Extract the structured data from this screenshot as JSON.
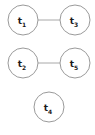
{
  "diagram": {
    "background_color": "#ffffff",
    "width": 95,
    "height": 135,
    "node_style": {
      "fill": "#ffffff",
      "stroke": "#9a9a9a",
      "radius": 15
    },
    "edge_style": {
      "stroke": "#a8a8a8"
    },
    "label_color": "#1a1a1a",
    "nodes": [
      {
        "id": "t1",
        "base": "t",
        "subscript": "1",
        "label": "t1",
        "cx": 23,
        "cy": 20
      },
      {
        "id": "t3",
        "base": "t",
        "subscript": "3",
        "label": "t3",
        "cx": 75,
        "cy": 20
      },
      {
        "id": "t2",
        "base": "t",
        "subscript": "2",
        "label": "t2",
        "cx": 23,
        "cy": 63
      },
      {
        "id": "t5",
        "base": "t",
        "subscript": "5",
        "label": "t5",
        "cx": 75,
        "cy": 63
      },
      {
        "id": "t4",
        "base": "t",
        "subscript": "4",
        "label": "t4",
        "cx": 49,
        "cy": 107
      }
    ],
    "edges": [
      {
        "id": "edge-t1-t3",
        "source": "t1",
        "target": "t3",
        "x1": 38,
        "y1": 20,
        "x2": 60,
        "y2": 20
      },
      {
        "id": "edge-t2-t5",
        "source": "t2",
        "target": "t5",
        "x1": 38,
        "y1": 63,
        "x2": 60,
        "y2": 63
      }
    ]
  }
}
